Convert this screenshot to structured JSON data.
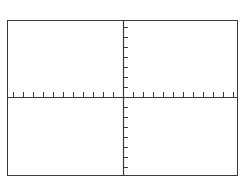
{
  "figure": {
    "type": "blank-cartesian-plane",
    "title": "",
    "background_color": "#ffffff",
    "line_color": "#3a3a3a",
    "frame": {
      "x": 7,
      "y": 20,
      "width": 231,
      "height": 156,
      "border_width": 1
    }
  },
  "chart_data": {
    "type": "scatter",
    "title": "",
    "subtitle": "",
    "xlabel": "",
    "ylabel": "",
    "series": [
      {
        "name": "",
        "x": [],
        "y": []
      }
    ],
    "x": [],
    "values": [],
    "categories": [],
    "xlim": [
      -11.6,
      11.5
    ],
    "ylim": [
      -7.9,
      7.7
    ],
    "x_tick_interval": 1,
    "y_tick_interval": 1,
    "x_tick_count": 23,
    "y_tick_count": 15,
    "x_tick_labels": [],
    "y_tick_labels": [],
    "grid": false,
    "legend": false,
    "legend_position": "none",
    "annotations": [],
    "axes": {
      "x_axis": {
        "name": "x-axis",
        "position_px": 97,
        "spans_full_width": true,
        "tick_direction": "up",
        "tick_length_px": 5,
        "tick_spacing_px": 10,
        "line_width": 1
      },
      "y_axis": {
        "name": "y-axis",
        "position_px": 123,
        "spans_full_height": true,
        "tick_direction": "right",
        "tick_length_px": 5,
        "tick_spacing_px": 10,
        "line_width": 1
      }
    },
    "quadrants": [
      {
        "name": "quadrant-II",
        "label": ""
      },
      {
        "name": "quadrant-I",
        "label": ""
      },
      {
        "name": "quadrant-III",
        "label": ""
      },
      {
        "name": "quadrant-IV",
        "label": ""
      }
    ]
  }
}
